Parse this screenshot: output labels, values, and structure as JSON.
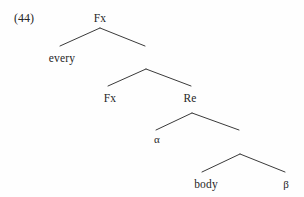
{
  "figure": {
    "example_number": "(44)",
    "width": 304,
    "height": 197,
    "background_color": "#fefefe",
    "line_color": "#3a3a3a",
    "text_color": "#262626"
  },
  "nodes": {
    "root": "Fx",
    "every": "every",
    "fx2": "Fx",
    "re": "Re",
    "alpha": "α",
    "body": "body",
    "beta": "β"
  },
  "tree_structure": {
    "type": "syntax-tree",
    "levels": [
      {
        "index": 1,
        "parent_label": "Fx",
        "parent_x": 100,
        "parent_y": 26,
        "children": [
          {
            "label": "every",
            "x": 62,
            "y": 60,
            "side": "left",
            "terminal": true
          },
          {
            "label": "",
            "x": 146,
            "y": 60,
            "side": "right",
            "terminal": false
          }
        ]
      },
      {
        "index": 2,
        "parent_label": "",
        "parent_x": 146,
        "parent_y": 68,
        "children": [
          {
            "label": "Fx",
            "x": 110,
            "y": 100,
            "side": "left",
            "terminal": true
          },
          {
            "label": "Re",
            "x": 190,
            "y": 100,
            "side": "right",
            "terminal": false
          }
        ]
      },
      {
        "index": 3,
        "parent_label": "Re",
        "parent_x": 192,
        "parent_y": 112,
        "children": [
          {
            "label": "α",
            "x": 157,
            "y": 140,
            "side": "left",
            "terminal": true
          },
          {
            "label": "",
            "x": 240,
            "y": 145,
            "side": "right",
            "terminal": false
          }
        ]
      },
      {
        "index": 4,
        "parent_label": "",
        "parent_x": 240,
        "parent_y": 153,
        "children": [
          {
            "label": "body",
            "x": 206,
            "y": 186,
            "side": "left",
            "terminal": true
          },
          {
            "label": "β",
            "x": 286,
            "y": 186,
            "side": "right",
            "terminal": true
          }
        ]
      }
    ],
    "branches": [
      {
        "name": "root-left",
        "x1": 100,
        "y1": 28,
        "x2": 60,
        "y2": 46
      },
      {
        "name": "root-right",
        "x1": 100,
        "y1": 28,
        "x2": 145,
        "y2": 46
      },
      {
        "name": "l2-left",
        "x1": 146,
        "y1": 69,
        "x2": 108,
        "y2": 86
      },
      {
        "name": "l2-right",
        "x1": 146,
        "y1": 69,
        "x2": 191,
        "y2": 86
      },
      {
        "name": "l3-left",
        "x1": 192,
        "y1": 113,
        "x2": 156,
        "y2": 130
      },
      {
        "name": "l3-right",
        "x1": 192,
        "y1": 113,
        "x2": 239,
        "y2": 130
      },
      {
        "name": "l4-left",
        "x1": 240,
        "y1": 154,
        "x2": 202,
        "y2": 172
      },
      {
        "name": "l4-right",
        "x1": 240,
        "y1": 154,
        "x2": 285,
        "y2": 172
      }
    ]
  }
}
